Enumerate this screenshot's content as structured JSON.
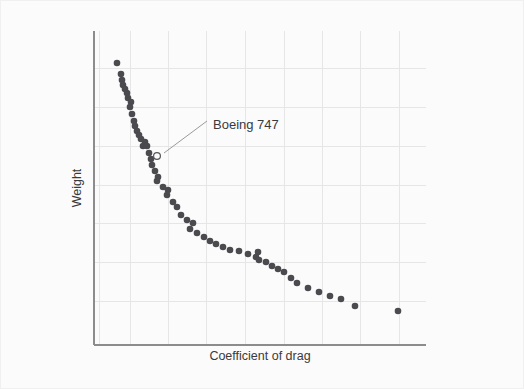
{
  "figure": {
    "background_color": "#fbfbfb",
    "plot_area": {
      "left": 93,
      "top": 30,
      "right": 425,
      "bottom": 344
    }
  },
  "colors": {
    "dot": "#4a4a4f",
    "axis": "#8c8c8c",
    "grid": "#e6e6e6",
    "leader": "#9a9a9a",
    "text": "#3a3a3a",
    "background": "#fbfbfb"
  },
  "annotation": {
    "label": "Boeing 747",
    "text_x": 212,
    "text_y": 128,
    "marker_x": 156,
    "marker_y": 155,
    "leader_from_x": 163,
    "leader_from_y": 152,
    "leader_to_x": 206,
    "leader_to_y": 120
  },
  "chart_data": {
    "type": "scatter",
    "title": "",
    "subtitle": "",
    "xlabel": "Coefficient of drag",
    "ylabel": "Weight",
    "xlim": [
      0,
      1
    ],
    "ylim": [
      0,
      1
    ],
    "grid": true,
    "x_tick_labels": [],
    "y_tick_labels": [],
    "legend": [],
    "x_gridlines_px": [
      98,
      129,
      167,
      205,
      244,
      283,
      321,
      359,
      398
    ],
    "y_gridlines_px": [
      67,
      106,
      145,
      184,
      222,
      261,
      300
    ],
    "highlighted_point": {
      "name": "Boeing 747",
      "x_px": 156,
      "y_px": 155
    },
    "points_px": [
      [
        116,
        62
      ],
      [
        120,
        73
      ],
      [
        121,
        79
      ],
      [
        122,
        84
      ],
      [
        124,
        88
      ],
      [
        126,
        92
      ],
      [
        127,
        97
      ],
      [
        130,
        101
      ],
      [
        129,
        106
      ],
      [
        131,
        113
      ],
      [
        133,
        120
      ],
      [
        134,
        125
      ],
      [
        136,
        130
      ],
      [
        138,
        134
      ],
      [
        140,
        138
      ],
      [
        144,
        141
      ],
      [
        142,
        145
      ],
      [
        146,
        145
      ],
      [
        148,
        152
      ],
      [
        150,
        158
      ],
      [
        151,
        164
      ],
      [
        154,
        170
      ],
      [
        157,
        176
      ],
      [
        156,
        180
      ],
      [
        162,
        186
      ],
      [
        167,
        189
      ],
      [
        166,
        194
      ],
      [
        172,
        201
      ],
      [
        176,
        206
      ],
      [
        180,
        214
      ],
      [
        186,
        219
      ],
      [
        192,
        222
      ],
      [
        189,
        228
      ],
      [
        196,
        232
      ],
      [
        203,
        236
      ],
      [
        209,
        240
      ],
      [
        215,
        243
      ],
      [
        222,
        246
      ],
      [
        229,
        249
      ],
      [
        238,
        250
      ],
      [
        247,
        253
      ],
      [
        255,
        256
      ],
      [
        257,
        251
      ],
      [
        258,
        259
      ],
      [
        265,
        261
      ],
      [
        271,
        265
      ],
      [
        277,
        268
      ],
      [
        283,
        271
      ],
      [
        290,
        277
      ],
      [
        296,
        282
      ],
      [
        307,
        287
      ],
      [
        318,
        291
      ],
      [
        329,
        295
      ],
      [
        340,
        298
      ],
      [
        354,
        305
      ],
      [
        397,
        310
      ]
    ]
  }
}
